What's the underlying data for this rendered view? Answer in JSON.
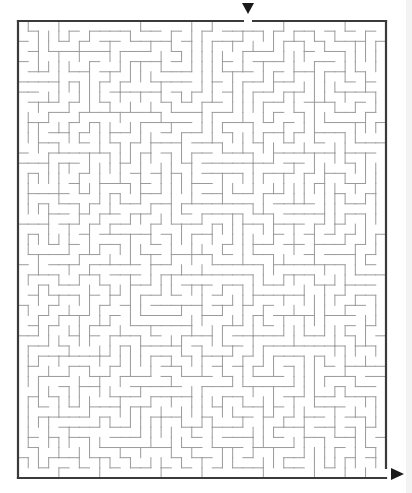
{
  "maze": {
    "frame": {
      "left": 18,
      "top": 21,
      "right": 386,
      "bottom": 478
    },
    "cols": 36,
    "rows": 45,
    "entrance": {
      "side": "top",
      "col": 22,
      "marker": "down-arrow"
    },
    "exit": {
      "side": "right",
      "row": 44,
      "marker": "right-arrow"
    },
    "colors": {
      "border": "#3a3a3a",
      "wall": "#9a9a9a",
      "arrow": "#1a1a1a",
      "background": "#ffffff"
    },
    "seed": 7321
  }
}
